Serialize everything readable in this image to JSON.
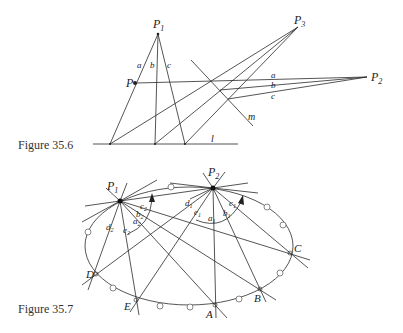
{
  "figures": [
    {
      "caption": "Figure 35.6",
      "labels": {
        "P1": "P",
        "P1_sub": "1",
        "P2": "P",
        "P2_sub": "2",
        "P3": "P",
        "P3_sub": "3",
        "P": "P",
        "a": "a",
        "b": "b",
        "c": "c",
        "a2": "a",
        "b2": "b",
        "c2": "c",
        "m": "m",
        "l": "l"
      }
    },
    {
      "caption": "Figure 35.7",
      "labels": {
        "P1": "P",
        "P1_sub": "1",
        "P2": "P",
        "P2_sub": "2",
        "A": "A",
        "B": "B",
        "C": "C",
        "D": "D",
        "E": "E",
        "a1": "a",
        "b1": "b",
        "c1": "c",
        "d1": "d",
        "e1": "e",
        "sub1": "1",
        "a2": "a",
        "b2": "b",
        "c2": "c",
        "d2": "d",
        "e2": "e",
        "sub2": "2"
      }
    }
  ]
}
